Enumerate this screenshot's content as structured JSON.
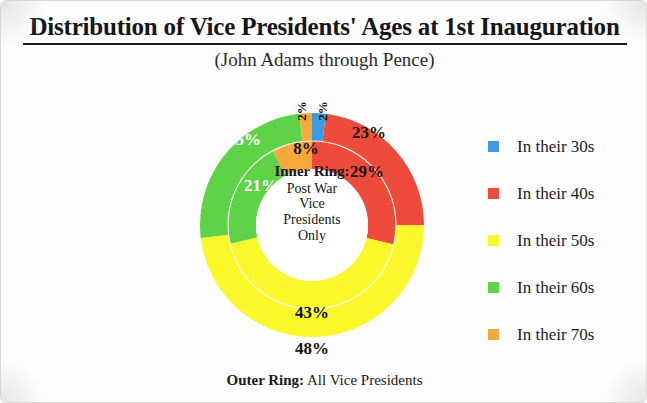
{
  "header": {
    "title": "Distribution of Vice Presidents' Ages at 1st Inauguration",
    "subtitle": "(John Adams through Pence)"
  },
  "center": {
    "heading": "Inner Ring:",
    "lines": [
      "Post War",
      "Vice",
      "Presidents",
      "Only"
    ]
  },
  "caption": {
    "bold": "Outer Ring:",
    "rest": " All Vice Presidents"
  },
  "legend": {
    "items": [
      {
        "label": "In their 30s",
        "color": "#3a9be0"
      },
      {
        "label": "In their 40s",
        "color": "#ee4b3c"
      },
      {
        "label": "In their 50s",
        "color": "#faf82a"
      },
      {
        "label": "In their 60s",
        "color": "#5fd348"
      },
      {
        "label": "In their 70s",
        "color": "#f5a93c"
      }
    ]
  },
  "chart_data": {
    "type": "pie",
    "title": "Distribution of Vice Presidents' Ages at 1st Inauguration",
    "subtitle": "(John Adams through Pence)",
    "legend_position": "right",
    "categories": [
      "In their 30s",
      "In their 40s",
      "In their 50s",
      "In their 60s",
      "In their 70s"
    ],
    "colors": [
      "#3a9be0",
      "#ee4b3c",
      "#faf82a",
      "#5fd348",
      "#f5a93c"
    ],
    "series": [
      {
        "name": "Outer Ring: All Vice Presidents",
        "ring": "outer",
        "values": [
          2,
          23,
          48,
          25,
          2
        ],
        "labels": [
          "2%",
          "23%",
          "48%",
          "25%",
          "2%"
        ]
      },
      {
        "name": "Inner Ring: Post War Vice Presidents Only",
        "ring": "inner",
        "values": [
          0,
          29,
          43,
          21,
          8
        ],
        "labels": [
          "",
          "29%",
          "43%",
          "21%",
          "8%"
        ]
      }
    ]
  },
  "pie_labels": {
    "outer": {
      "blue": "2%",
      "red": "23%",
      "yellow": "48%",
      "green": "25%",
      "orange": "2%"
    },
    "inner": {
      "red": "29%",
      "yellow": "43%",
      "green": "21%",
      "orange": "8%"
    }
  }
}
